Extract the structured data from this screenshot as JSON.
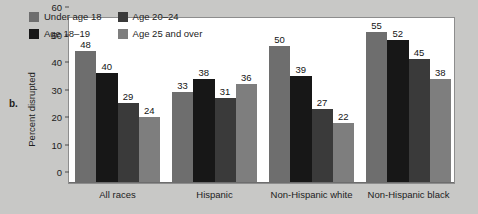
{
  "panel": {
    "label": "b."
  },
  "chart_data": {
    "type": "bar",
    "title": "",
    "xlabel": "",
    "ylabel": "Percent disrupted",
    "ylim": [
      0,
      60
    ],
    "yticks": [
      0,
      10,
      20,
      30,
      40,
      50,
      60
    ],
    "grid": false,
    "legend_position": "top-left-inside",
    "categories": [
      "All races",
      "Hispanic",
      "Non-Hispanic white",
      "Non-Hispanic black"
    ],
    "series": [
      {
        "name": "Under age 18",
        "color": "#6e6e6e",
        "values": [
          48,
          33,
          50,
          55
        ]
      },
      {
        "name": "Age 18–19",
        "color": "#171717",
        "values": [
          40,
          38,
          39,
          52
        ]
      },
      {
        "name": "Age 20–24",
        "color": "#3a3a3a",
        "values": [
          29,
          31,
          27,
          45
        ]
      },
      {
        "name": "Age 25 and over",
        "color": "#7e7e7e",
        "values": [
          24,
          36,
          22,
          38
        ]
      }
    ]
  },
  "colors": {
    "page_background": "#c8c8c6",
    "plot_background": "#ffffff",
    "frame": "#8d8d8d",
    "text": "#1c1c1c"
  }
}
